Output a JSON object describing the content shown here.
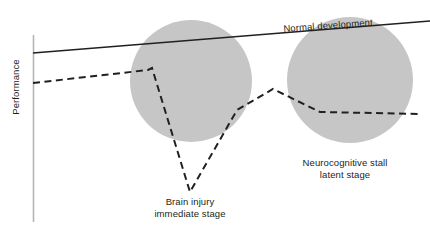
{
  "figure": {
    "background_color": "#ffffff",
    "axis": {
      "y_axis_label": "Performance",
      "axis_color": "#b5b5b5"
    },
    "annotations": {
      "normal_development": "Normal development",
      "brain_injury_line1": "Brain injury",
      "brain_injury_line2": "immediate stage",
      "neurocognitive_stall_line1": "Neurocognitive stall",
      "neurocognitive_stall_line2": "latent stage"
    },
    "colors": {
      "line": "#231f20",
      "circle_fill": "#c6c6c6",
      "text": "#231f20",
      "axis": "#b5b5b5"
    }
  },
  "chart_data": {
    "type": "line",
    "title": "",
    "xlabel": "",
    "ylabel": "Performance",
    "grid": false,
    "legend": "none",
    "xlim": [
      33,
      430
    ],
    "ylim": [
      232,
      0
    ],
    "axis_note": "y axis drawn as a plain vertical rule at x=33 from y=35 to y=222; no x axis, no tick labels",
    "series": [
      {
        "name": "Normal development",
        "style": "solid",
        "color": "#231f20",
        "points": [
          [
            33,
            53
          ],
          [
            430,
            21
          ]
        ]
      },
      {
        "name": "Injured trajectory",
        "style": "dashed",
        "color": "#231f20",
        "points": [
          [
            33,
            83
          ],
          [
            148,
            70
          ],
          [
            152,
            68
          ],
          [
            190,
            192
          ],
          [
            237,
            110
          ],
          [
            273,
            89
          ],
          [
            320,
            112
          ],
          [
            422,
            114
          ]
        ]
      }
    ],
    "shaded_regions": [
      {
        "name": "Brain injury immediate stage",
        "shape": "circle",
        "cx": 191,
        "cy": 81,
        "r": 61,
        "fill": "#c6c6c6"
      },
      {
        "name": "Neurocognitive stall latent stage",
        "shape": "circle",
        "cx": 350,
        "cy": 80,
        "r": 63,
        "fill": "#c6c6c6"
      }
    ]
  }
}
